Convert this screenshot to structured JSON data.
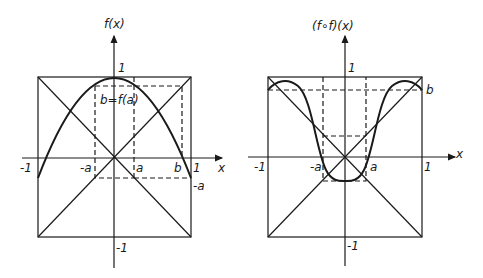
{
  "panels": [
    {
      "id": "left",
      "y_axis_label": "f(x)",
      "x_axis_label": "x",
      "tick_labels": {
        "x_neg_one": "-1",
        "x_neg_a": "-a",
        "x_a": "a",
        "x_b": "b",
        "x_one": "1",
        "y_one": "1",
        "y_neg_one": "-1",
        "y_neg_a": "-a"
      },
      "annotation": "b=f(a)",
      "function": "f(x) = 1 - 1.26 x^2"
    },
    {
      "id": "right",
      "y_axis_label": "(f∘f)(x)",
      "x_axis_label": "x",
      "tick_labels": {
        "x_neg_one": "-1",
        "x_neg_a": "-a",
        "x_a": "a",
        "x_one": "1",
        "y_one": "1",
        "y_neg_one": "-1",
        "y_b": "b"
      },
      "function": "(f∘f)(x)"
    }
  ],
  "colors": {
    "ink": "#1a1a1a",
    "background": "#ffffff"
  }
}
